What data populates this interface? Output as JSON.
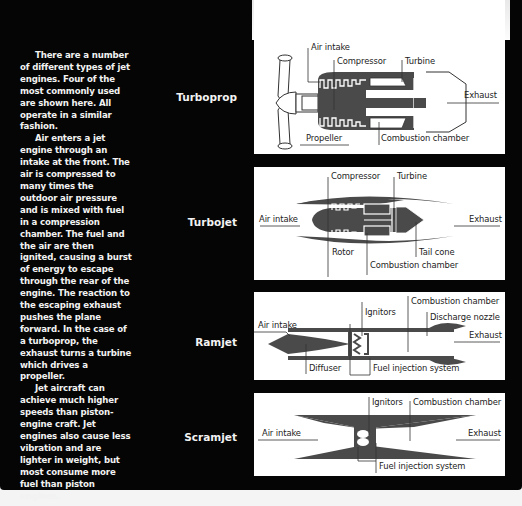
{
  "intro": {
    "paragraphs": [
      "There are a number of different types of jet engines. Four of the most commonly used are shown here. All operate in a similar fashion.",
      "Air enters a jet engine through an intake at the front. The air is compressed to many times the outdoor air pressure and is mixed with fuel in a compression chamber. The fuel and the air are then ignited, causing a burst of energy to escape through the rear of the engine. The reaction to the escaping exhaust pushes the plane forward. In the case of a turboprop, the exhaust turns a turbine which drives a propeller.",
      "Jet aircraft can achieve much higher speeds than piston-engine craft. Jet engines also cause less vibration and are lighter in weight, but most consume more fuel than piston engines."
    ]
  },
  "engines": [
    {
      "name": "Turboprop",
      "labels": {
        "air_intake": "Air intake",
        "compressor": "Compressor",
        "turbine": "Turbine",
        "exhaust": "Exhaust",
        "propeller": "Propeller",
        "combustion_chamber": "Combustion chamber"
      }
    },
    {
      "name": "Turbojet",
      "labels": {
        "compressor": "Compressor",
        "turbine": "Turbine",
        "air_intake": "Air intake",
        "exhaust": "Exhaust",
        "rotor": "Rotor",
        "tail_cone": "Tail cone",
        "combustion_chamber": "Combustion chamber"
      }
    },
    {
      "name": "Ramjet",
      "labels": {
        "combustion_chamber": "Combustion chamber",
        "ignitors": "Ignitors",
        "discharge_nozzle": "Discharge nozzle",
        "air_intake": "Air intake",
        "exhaust": "Exhaust",
        "diffuser": "Diffuser",
        "fuel_injection_system": "Fuel injection system"
      }
    },
    {
      "name": "Scramjet",
      "labels": {
        "ignitors": "Ignitors",
        "combustion_chamber": "Combustion chamber",
        "air_intake": "Air intake",
        "exhaust": "Exhaust",
        "fuel_injection_system": "Fuel injection system"
      }
    }
  ],
  "colors": {
    "page_background": "#050505",
    "panel_background": "#ffffff",
    "engine_fill": "#4a4a4a",
    "text_light": "#f2f2f2",
    "text_dark": "#222222"
  }
}
